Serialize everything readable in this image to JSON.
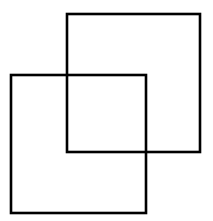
{
  "canvas": {
    "width": 213,
    "height": 221,
    "background_color": "#ffffff"
  },
  "figure": {
    "name": "two-overlapping-squares",
    "stroke_color": "#000000",
    "stroke_width": 2.6,
    "fill": "none",
    "shapes": [
      {
        "id": "square-upper-right",
        "label": "Upper right square",
        "x": 67,
        "y": 14,
        "width": 133,
        "height": 138
      },
      {
        "id": "square-lower-left",
        "label": "Lower left square",
        "x": 11,
        "y": 75,
        "width": 135,
        "height": 138
      }
    ],
    "overlap_region": {
      "x": 67,
      "y": 75,
      "width": 79,
      "height": 77
    }
  }
}
